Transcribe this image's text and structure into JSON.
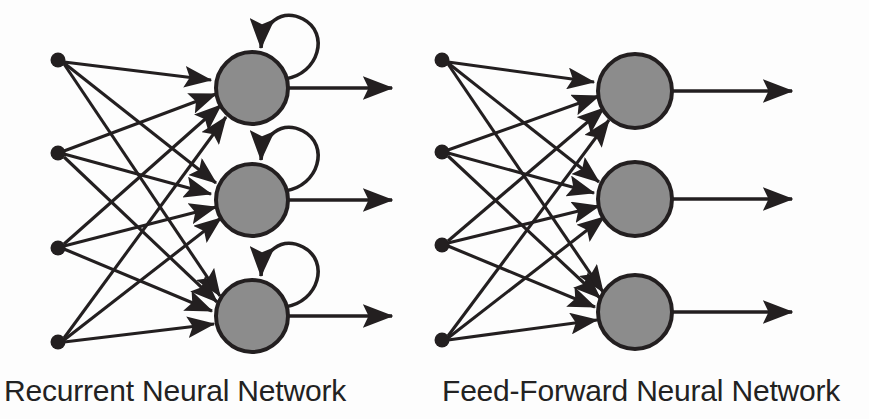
{
  "figure": {
    "background_color": "#fdfdfd",
    "stroke_color": "#231f20",
    "node_fill_color": "#8c8c8c",
    "node_stroke_color": "#231f20",
    "label_color": "#222222"
  },
  "networks": [
    {
      "id": "recurrent",
      "label": "Recurrent Neural Network",
      "has_self_loops": true,
      "self_loop_icon": "self-loop-arrow-icon",
      "input_layer": {
        "name": "input-nodes",
        "count": 4,
        "shape": "filled-dot",
        "radius": 7,
        "nodes": [
          {
            "id": "rnn-input-1",
            "x": 58,
            "y": 60
          },
          {
            "id": "rnn-input-2",
            "x": 58,
            "y": 153
          },
          {
            "id": "rnn-input-3",
            "x": 58,
            "y": 248
          },
          {
            "id": "rnn-input-4",
            "x": 58,
            "y": 342
          }
        ]
      },
      "hidden_layer": {
        "name": "neuron-nodes",
        "count": 3,
        "shape": "gray-circle",
        "radius": 36,
        "nodes": [
          {
            "id": "rnn-neuron-1",
            "x": 252,
            "y": 88
          },
          {
            "id": "rnn-neuron-2",
            "x": 252,
            "y": 200
          },
          {
            "id": "rnn-neuron-3",
            "x": 252,
            "y": 316
          }
        ]
      },
      "outputs": [
        {
          "id": "rnn-output-1",
          "x1": 288,
          "y": 88,
          "x2": 392
        },
        {
          "id": "rnn-output-2",
          "x1": 288,
          "y": 200,
          "x2": 392
        },
        {
          "id": "rnn-output-3",
          "x1": 288,
          "y": 316,
          "x2": 392
        }
      ],
      "connections": "fully-connected 4 inputs to 3 neurons"
    },
    {
      "id": "feed-forward",
      "label": "Feed-Forward Neural Network",
      "has_self_loops": false,
      "input_layer": {
        "name": "input-nodes",
        "count": 4,
        "shape": "filled-dot",
        "radius": 7,
        "nodes": [
          {
            "id": "ffnn-input-1",
            "x": 442,
            "y": 60
          },
          {
            "id": "ffnn-input-2",
            "x": 442,
            "y": 152
          },
          {
            "id": "ffnn-input-3",
            "x": 442,
            "y": 245
          },
          {
            "id": "ffnn-input-4",
            "x": 442,
            "y": 340
          }
        ]
      },
      "hidden_layer": {
        "name": "neuron-nodes",
        "count": 3,
        "shape": "gray-circle",
        "radius": 37,
        "nodes": [
          {
            "id": "ffnn-neuron-1",
            "x": 635,
            "y": 91
          },
          {
            "id": "ffnn-neuron-2",
            "x": 635,
            "y": 199
          },
          {
            "id": "ffnn-neuron-3",
            "x": 635,
            "y": 312
          }
        ]
      },
      "outputs": [
        {
          "id": "ffnn-output-1",
          "x1": 672,
          "y": 91,
          "x2": 792
        },
        {
          "id": "ffnn-output-2",
          "x1": 672,
          "y": 199,
          "x2": 792
        },
        {
          "id": "ffnn-output-3",
          "x1": 672,
          "y": 312,
          "x2": 792
        }
      ],
      "connections": "fully-connected 4 inputs to 3 neurons"
    }
  ],
  "labels": {
    "left": "Recurrent Neural Network",
    "right": "Feed-Forward Neural Network"
  }
}
